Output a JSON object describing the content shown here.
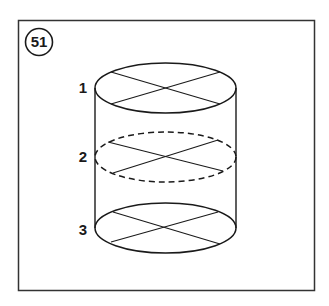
{
  "figure": {
    "number": "51",
    "labels": [
      "1",
      "2",
      "3"
    ]
  },
  "colors": {
    "stroke": "#1a1a1a",
    "background": "#ffffff",
    "frame": "#333333"
  }
}
